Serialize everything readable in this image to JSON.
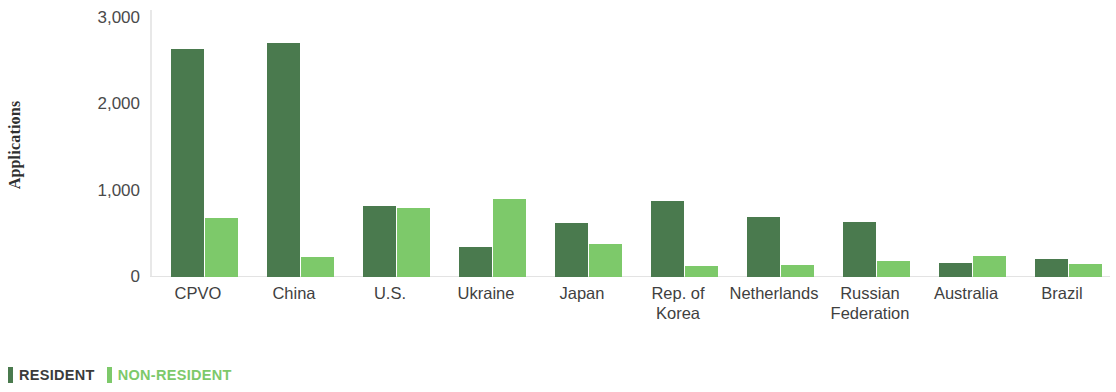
{
  "chart_data": {
    "type": "bar",
    "title": "",
    "subtitle": "",
    "xlabel": "",
    "ylabel": "Applications",
    "ylim": [
      0,
      3000
    ],
    "yticks": [
      0,
      1000,
      2000,
      3000
    ],
    "ytick_labels": [
      "0",
      "1,000",
      "2,000",
      "3,000"
    ],
    "grid": false,
    "legend_position": "bottom-left",
    "categories": [
      "CPVO",
      "China",
      "U.S.",
      "Ukraine",
      "Japan",
      "Rep. of Korea",
      "Netherlands",
      "Russian Federation",
      "Australia",
      "Brazil"
    ],
    "category_lines": [
      [
        "CPVO"
      ],
      [
        "China"
      ],
      [
        "U.S."
      ],
      [
        "Ukraine"
      ],
      [
        "Japan"
      ],
      [
        "Rep. of",
        "Korea"
      ],
      [
        "Netherlands"
      ],
      [
        "Russian",
        "Federation"
      ],
      [
        "Australia"
      ],
      [
        "Brazil"
      ]
    ],
    "series": [
      {
        "name": "RESIDENT",
        "color": "#4a7a4e",
        "values": [
          2640,
          2710,
          820,
          347,
          620,
          880,
          700,
          640,
          162,
          210
        ]
      },
      {
        "name": "NON-RESIDENT",
        "color": "#7dc96a",
        "values": [
          684,
          237,
          800,
          903,
          380,
          125,
          140,
          180,
          243,
          155
        ]
      }
    ]
  },
  "legend": {
    "items": [
      {
        "label": "RESIDENT",
        "color": "#4a7a4e"
      },
      {
        "label": "NON-RESIDENT",
        "color": "#7dc96a"
      }
    ]
  },
  "axis": {
    "y_title": "Applications"
  }
}
